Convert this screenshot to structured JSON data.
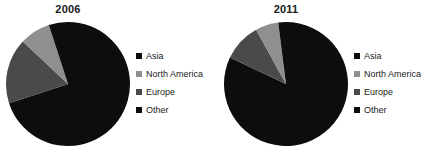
{
  "chart_data": [
    {
      "type": "pie",
      "title": "2006",
      "categories": [
        "Asia",
        "North America",
        "Europe",
        "Other"
      ],
      "values": [
        70,
        17,
        8,
        5
      ],
      "colors": [
        "#0d0d0d",
        "#4a4a4a",
        "#8f8f8f",
        "#0d0d0d"
      ],
      "start_angle": 0,
      "direction": "clockwise",
      "legend_position": "right",
      "grid": false
    },
    {
      "type": "pie",
      "title": "2011",
      "categories": [
        "Asia",
        "North America",
        "Europe",
        "Other"
      ],
      "values": [
        82,
        10,
        6,
        2
      ],
      "colors": [
        "#0d0d0d",
        "#4a4a4a",
        "#8f8f8f",
        "#0d0d0d"
      ],
      "start_angle": 0,
      "direction": "clockwise",
      "legend_position": "right",
      "grid": false
    }
  ],
  "charts": [
    {
      "title": "2006",
      "legend": [
        {
          "label": "Asia",
          "color": "#0d0d0d"
        },
        {
          "label": "North America",
          "color": "#8f8f8f"
        },
        {
          "label": "Europe",
          "color": "#4a4a4a"
        },
        {
          "label": "Other",
          "color": "#0d0d0d"
        }
      ]
    },
    {
      "title": "2011",
      "legend": [
        {
          "label": "Asia",
          "color": "#0d0d0d"
        },
        {
          "label": "North America",
          "color": "#8f8f8f"
        },
        {
          "label": "Europe",
          "color": "#4a4a4a"
        },
        {
          "label": "Other",
          "color": "#0d0d0d"
        }
      ]
    }
  ]
}
